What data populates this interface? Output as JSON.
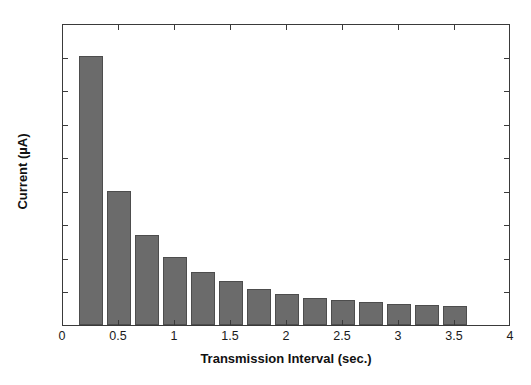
{
  "chart_data": {
    "type": "bar",
    "title": "",
    "xlabel": "Transmission Interval (sec.)",
    "ylabel": "Current (µA)",
    "xlim": [
      0,
      4
    ],
    "ylim": [
      0,
      450
    ],
    "grid": false,
    "legend": null,
    "bar_color": "#6b6b6b",
    "bar_edge_color": "#4d4d4d",
    "axis_color": "#3a3a3a",
    "background_color": "#ffffff",
    "bar_width": 0.22,
    "x": [
      0.25,
      0.5,
      0.75,
      1.0,
      1.25,
      1.5,
      1.75,
      2.0,
      2.25,
      2.5,
      2.75,
      3.0,
      3.25,
      3.5
    ],
    "values": [
      401,
      200,
      134,
      101,
      79,
      66,
      54,
      46,
      41,
      37,
      34,
      32,
      30,
      29
    ],
    "xticks": [
      0,
      0.5,
      1,
      1.5,
      2,
      2.5,
      3,
      3.5,
      4
    ],
    "xticklabels": [
      "0",
      "0.5",
      "1",
      "1.5",
      "2",
      "2.5",
      "3",
      "3.5",
      "4"
    ],
    "yticks": [
      0,
      50,
      100,
      150,
      200,
      250,
      300,
      350,
      400,
      450
    ],
    "yticklabels": [
      "0",
      "50",
      "100",
      "150",
      "200",
      "250",
      "300",
      "350",
      "400",
      "450"
    ]
  }
}
